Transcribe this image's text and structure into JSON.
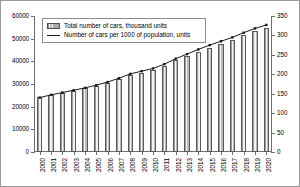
{
  "chart_data": {
    "type": "bar",
    "title": "",
    "xlabel": "",
    "ylabel": "",
    "grid": false,
    "legend_position": "top-left",
    "categories": [
      "2000",
      "2001",
      "2002",
      "2003",
      "2004",
      "2005",
      "2006",
      "2007",
      "2008",
      "2009",
      "2010",
      "2011",
      "2012",
      "2013",
      "2014",
      "2015",
      "2016",
      "2017",
      "2018",
      "2019",
      "2020"
    ],
    "y_left": {
      "label": "Total number of cars, thousand units",
      "ticks": [
        0,
        10000,
        20000,
        30000,
        40000,
        50000,
        60000
      ],
      "tick_labels": [
        "0",
        "10000",
        "20000",
        "30000",
        "40000",
        "50000",
        "60000"
      ],
      "ylim": [
        0,
        60000
      ]
    },
    "y_right": {
      "label": "Number of cars per 1000 of population, units",
      "ticks": [
        0,
        50,
        100,
        150,
        200,
        250,
        300,
        350
      ],
      "tick_labels": [
        "0",
        "50",
        "100",
        "150",
        "200",
        "250",
        "300",
        "350"
      ],
      "ylim": [
        0,
        350
      ]
    },
    "series": [
      {
        "name": "Total number of cars, thousand units",
        "type": "bar",
        "axis": "left",
        "values": [
          24200,
          25300,
          26200,
          27100,
          28100,
          29300,
          30600,
          32100,
          33900,
          35000,
          36100,
          38000,
          40400,
          42300,
          44300,
          46100,
          47800,
          49500,
          51500,
          53300,
          54800
        ]
      },
      {
        "name": "Number of cars per 1000 of population, units",
        "type": "line",
        "axis": "right",
        "values": [
          140,
          147,
          153,
          159,
          165,
          172,
          180,
          190,
          201,
          208,
          215,
          226,
          240,
          252,
          264,
          275,
          285,
          295,
          307,
          318,
          327
        ]
      }
    ]
  },
  "legend": {
    "items": [
      {
        "label": "Total number of cars, thousand units",
        "marker": "bar-swatch-icon"
      },
      {
        "label": "Number of cars per 1000 of population, units",
        "marker": "line-swatch-icon"
      }
    ]
  }
}
